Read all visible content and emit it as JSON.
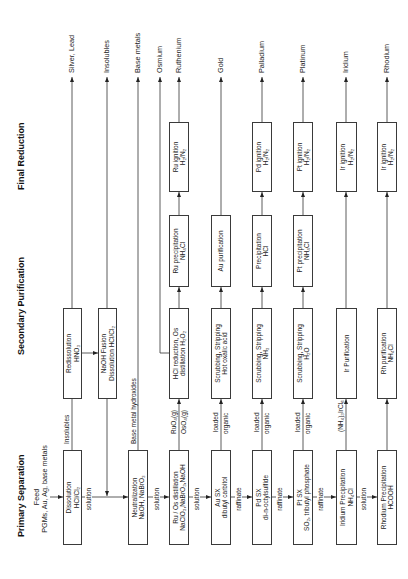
{
  "stages": {
    "primary": "Primary Separation",
    "secondary": "Secondary Purification",
    "final": "Final Reduction"
  },
  "feed": {
    "title": "Feed",
    "materials": "PGMs, Au, Ag, base metals"
  },
  "primary": {
    "dissolution": {
      "l1": "Dissolution",
      "l2": "HCl/Cl₂"
    },
    "neutralization": {
      "l1": "Neutralization",
      "l2": "NaOH, NaBrO₃"
    },
    "ru_os_distillation": {
      "l1": "Ru / Os distillation",
      "l2": "NaClO₃,NaBrO₃,NaOH"
    },
    "au_sx": {
      "l1": "Au SX",
      "l2": "dibutyl carbitol"
    },
    "pd_sx": {
      "l1": "Pd SX",
      "l2": "di-n-octylsulfide"
    },
    "pt_sx": {
      "l1": "Pt SX",
      "l2": "SO₂, tributyl phosphate"
    },
    "ir_precipitation": {
      "l1": "Iridium Precipitation",
      "l2": "NH₄Cl"
    },
    "rh_precipitation": {
      "l1": "Rhodium Precipitation",
      "l2": "HCOOH"
    }
  },
  "secondary": {
    "redissolution": {
      "l1": "Redissolution",
      "l2": "HNO₃"
    },
    "naoh_fusion": {
      "l1": "NaOH Fusion",
      "l2": "Dissolution HCl/Cl₂"
    },
    "hcl_reduction": {
      "l1": "HCl reduction, Os",
      "l2": "distillation H₂O₂"
    },
    "au_scrub": {
      "l1": "Scrubbing, Stripping",
      "l2": "Hot oxalic acid"
    },
    "pd_scrub": {
      "l1": "Scrubbing, Stripping",
      "l2": "NH₃"
    },
    "pt_scrub": {
      "l1": "Scrubbing, Stripping",
      "l2": "H₂O"
    },
    "ir_purification": {
      "l1": "Ir Purification"
    },
    "rh_purification": {
      "l1": "Rh purification",
      "l2": "NH₄Cl"
    },
    "ru_precipitation": {
      "l1": "Ru precipitation",
      "l2": "NH₄Cl"
    },
    "au_purification": {
      "l1": "Au purification"
    },
    "pd_precipitation": {
      "l1": "Precipitation",
      "l2": "HCl"
    },
    "pt_precipitation": {
      "l1": "Pt precipitation",
      "l2": "NH₄Cl"
    }
  },
  "final": {
    "ru_ignition": {
      "l1": "Ru ignition",
      "l2": "H₂/N₂"
    },
    "pd_ignition": {
      "l1": "Pd ignition",
      "l2": "H₂/N₂"
    },
    "pt_ignition": {
      "l1": "Pt ignition",
      "l2": "H₂/N₂"
    },
    "ir_ignition": {
      "l1": "Ir ignition",
      "l2": "H₂/N₂"
    },
    "rh_ignition": {
      "l1": "Ir ignition",
      "l2": "H₂/N₂"
    }
  },
  "primary_stream": [
    "solution",
    "solution",
    "solution",
    "raffinate",
    "raffinate",
    "raffinate",
    "solution"
  ],
  "side_streams": {
    "insolubles": "Insolubles",
    "base_metal_hydroxides": "Base metal hydroxides",
    "ruo4": "RuO₄(g)",
    "oso4": "OsO₄(g)",
    "au_loaded": [
      "loaded",
      "organic"
    ],
    "pd_loaded": [
      "loaded",
      "organic"
    ],
    "pt_loaded": [
      "loaded",
      "organic"
    ],
    "ir_salt": "(NH₄)₃IrCl₆"
  },
  "outputs": [
    "Silver, Lead",
    "Insolubles",
    "Base metals",
    "Osmium",
    "Ruthenium",
    "Gold",
    "Palladium",
    "Platinum",
    "Iridium",
    "Rhodium"
  ]
}
